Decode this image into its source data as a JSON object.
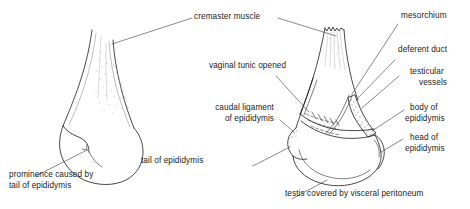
{
  "figure": {
    "ink_color": "#1c1c1c",
    "background": "#ffffff",
    "panels": [
      {
        "id": "left-panel",
        "name": "intact-testis-view",
        "description": "Intact testis within scrotum, cranial aspect"
      },
      {
        "id": "right-panel",
        "name": "dissected-testis-view",
        "description": "Testis with vaginal tunic opened showing epididymis and mesorchium"
      }
    ]
  },
  "labels": {
    "cremaster_muscle": "cremaster muscle",
    "prominence_line1": "prominence caused by",
    "prominence_line2": "tail of epididymis",
    "vaginal_tunic_opened": "vaginal tunic opened",
    "caudal_ligament_line1": "caudal ligament",
    "caudal_ligament_line2": "of epididymis",
    "tail_of_epididymis": "tail of epididymis",
    "mesorchium": "mesorchium",
    "deferent_duct": "deferent duct",
    "testicular_line1": "testicular",
    "testicular_line2": "vessels",
    "body_line1": "body of",
    "body_line2": "epididymis",
    "head_line1": "head of",
    "head_line2": "epididymis",
    "testis_covered": "testis covered by visceral peritoneum"
  }
}
